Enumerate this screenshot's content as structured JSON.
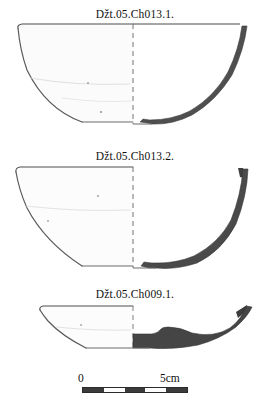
{
  "plate": {
    "background_color": "#ffffff",
    "ink_color": "#1a1a1a",
    "section_fill_color": "#4a4a4a",
    "outline_color": "#555555"
  },
  "figures": [
    {
      "label": "Džt.05.Ch013.1.",
      "shape_name": "deep-bowl-profile",
      "description": "deep hemispherical bowl, rounded wall, flat base"
    },
    {
      "label": "Džt.05.Ch013.2.",
      "shape_name": "conical-bowl-profile",
      "description": "deep conical bowl, straight flaring wall, flat base"
    },
    {
      "label": "Džt.05.Ch009.1.",
      "shape_name": "shallow-dish-profile",
      "description": "shallow dish, flaring wall, thick flat base"
    }
  ],
  "scale": {
    "start_label": "0",
    "end_label": "5cm",
    "segments": 5,
    "unit": "cm",
    "total_length_cm": 5
  }
}
